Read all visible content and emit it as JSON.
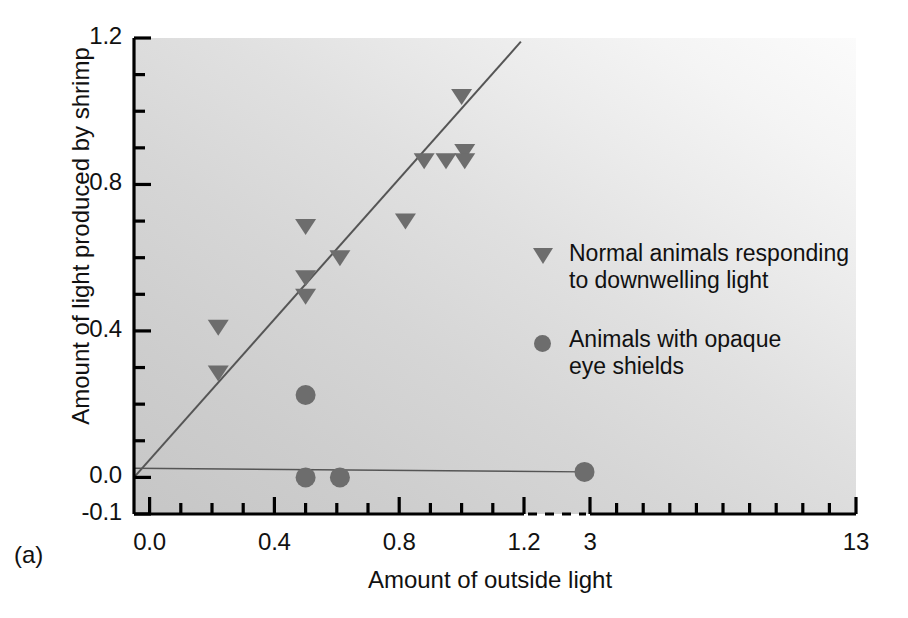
{
  "figure": {
    "panel_label": "(a)",
    "marker_color": "#6d6d6d",
    "line_color": "#555555",
    "axis_color": "#000000",
    "background_light": "#fbfbfb",
    "background_dark": "#c6c6c6"
  },
  "chart_data": {
    "type": "scatter",
    "title": "",
    "xlabel": "Amount of outside light",
    "ylabel": "Amount of light produced by shrimp",
    "xlim": [
      -0.05,
      13
    ],
    "ylim": [
      -0.1,
      1.2
    ],
    "grid": false,
    "legend_position": "inside-right",
    "axis_break": {
      "present": true,
      "between": [
        1.2,
        3.0
      ],
      "style": "dashed",
      "note": "linear 0.0-1.2, then compressed scale 3-13"
    },
    "x_tick_labels": [
      "0.0",
      "0.4",
      "0.8",
      "1.2",
      "3",
      "13"
    ],
    "x_tick_values": [
      0.0,
      0.4,
      0.8,
      1.2,
      3,
      13
    ],
    "x_minor_step": 0.1,
    "y_tick_labels": [
      "-0.1",
      "0.0",
      "0.4",
      "0.8",
      "1.2"
    ],
    "y_tick_values": [
      -0.1,
      0.0,
      0.4,
      0.8,
      1.2
    ],
    "y_minor_step": 0.1,
    "series": [
      {
        "name": "Normal animals responding to downwelling light",
        "marker": "triangle-down",
        "color": "#6d6d6d",
        "points": [
          {
            "x": 0.22,
            "y": 0.41
          },
          {
            "x": 0.22,
            "y": 0.285
          },
          {
            "x": 0.5,
            "y": 0.685
          },
          {
            "x": 0.5,
            "y": 0.545
          },
          {
            "x": 0.5,
            "y": 0.495
          },
          {
            "x": 0.61,
            "y": 0.6
          },
          {
            "x": 0.82,
            "y": 0.7
          },
          {
            "x": 0.88,
            "y": 0.865
          },
          {
            "x": 0.95,
            "y": 0.865
          },
          {
            "x": 1.0,
            "y": 1.04
          },
          {
            "x": 1.01,
            "y": 0.89
          },
          {
            "x": 1.01,
            "y": 0.865
          }
        ],
        "trendline": {
          "x0": -0.05,
          "y0": 0.0,
          "x1": 1.19,
          "y1": 1.19
        }
      },
      {
        "name": "Animals with opaque eye shields",
        "marker": "circle",
        "color": "#6d6d6d",
        "points": [
          {
            "x": 0.5,
            "y": 0.225
          },
          {
            "x": 0.5,
            "y": 0.0
          },
          {
            "x": 0.61,
            "y": 0.0
          },
          {
            "x": 2.85,
            "y": 0.015
          }
        ],
        "trendline": {
          "x0": -0.05,
          "y0": 0.025,
          "x1": 2.85,
          "y1": 0.015
        }
      }
    ],
    "legend": [
      {
        "marker": "triangle-down",
        "label": "Normal animals responding\nto downwelling light"
      },
      {
        "marker": "circle",
        "label": "Animals with opaque\neye shields"
      }
    ]
  }
}
